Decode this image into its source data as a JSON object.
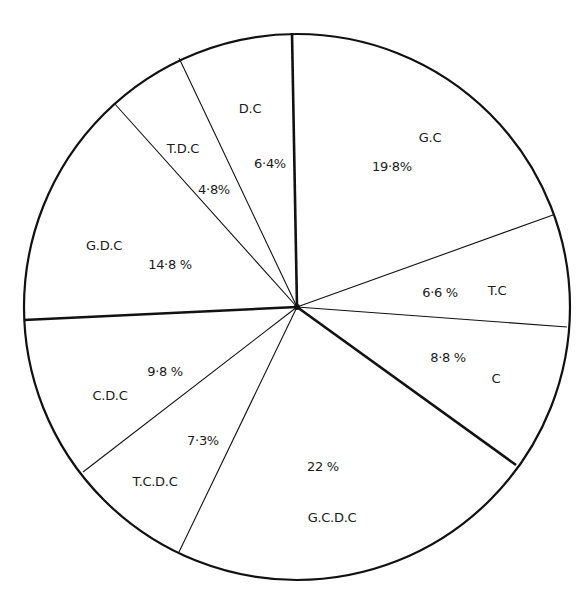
{
  "chart_data": {
    "type": "pie",
    "title": "",
    "slices": [
      {
        "label": "G.C",
        "value": 19.8,
        "value_text": "19·8%"
      },
      {
        "label": "T.C",
        "value": 6.6,
        "value_text": "6·6 %"
      },
      {
        "label": "C",
        "value": 8.8,
        "value_text": "8·8 %"
      },
      {
        "label": "G.C.D.C",
        "value": 22,
        "value_text": "22 %"
      },
      {
        "label": "T.C.D.C",
        "value": 7.3,
        "value_text": "7·3%"
      },
      {
        "label": "C.D.C",
        "value": 9.8,
        "value_text": "9·8 %"
      },
      {
        "label": "G.D.C",
        "value": 14.8,
        "value_text": "14·8 %"
      },
      {
        "label": "T.D.C",
        "value": 4.8,
        "value_text": "4·8%"
      },
      {
        "label": "D.C",
        "value": 6.4,
        "value_text": "6·4%"
      }
    ],
    "legend": "none (labels inside slices)",
    "colors": {
      "stroke": "#111111",
      "fill": "#ffffff"
    }
  },
  "geometry": {
    "cx": 297,
    "cy": 307,
    "r": 273,
    "boundaries": [
      {
        "x": 292,
        "y": 33,
        "thick": true
      },
      {
        "x": 553,
        "y": 215,
        "thick": false
      },
      {
        "x": 567,
        "y": 327,
        "thick": false
      },
      {
        "x": 516,
        "y": 465,
        "thick": true
      },
      {
        "x": 179,
        "y": 552,
        "thick": false
      },
      {
        "x": 83,
        "y": 472,
        "thick": false
      },
      {
        "x": 24,
        "y": 320,
        "thick": true
      },
      {
        "x": 114,
        "y": 103,
        "thick": false
      },
      {
        "x": 179,
        "y": 58,
        "thick": false
      }
    ]
  },
  "labels": {
    "gc_name": "G.C",
    "gc_pct": "19·8%",
    "tc_name": "T.C",
    "tc_pct": "6·6 %",
    "c_name": "C",
    "c_pct": "8·8 %",
    "gcdc_name": "G.C.D.C",
    "gcdc_pct": "22 %",
    "tcdc_name": "T.C.D.C",
    "tcdc_pct": "7·3%",
    "cdc_name": "C.D.C",
    "cdc_pct": "9·8 %",
    "gdc_name": "G.D.C",
    "gdc_pct": "14·8 %",
    "tdc_name": "T.D.C",
    "tdc_pct": "4·8%",
    "dc_name": "D.C",
    "dc_pct": "6·4%"
  }
}
